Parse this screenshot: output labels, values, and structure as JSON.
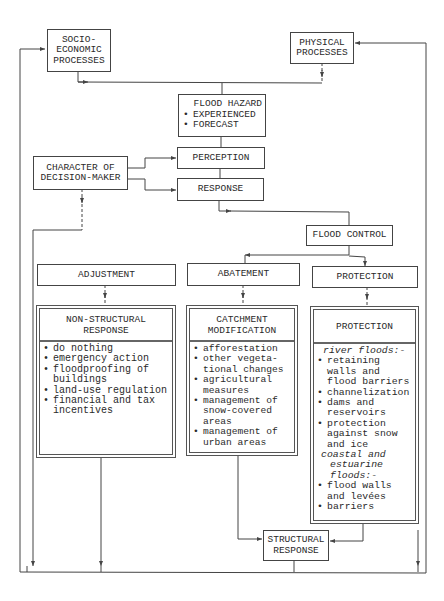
{
  "diagram": {
    "nodes": {
      "socio": {
        "lines": [
          "SOCIO-",
          "ECONOMIC",
          "PROCESSES"
        ]
      },
      "physical": {
        "lines": [
          "PHYSICAL",
          "PROCESSES"
        ]
      },
      "hazard": {
        "title": "FLOOD HAZARD",
        "bullets": [
          "EXPERIENCED",
          "FORECAST"
        ]
      },
      "character": {
        "lines": [
          "CHARACTER OF",
          "DECISION-MAKER"
        ]
      },
      "perception": {
        "label": "PERCEPTION"
      },
      "response": {
        "label": "RESPONSE"
      },
      "flood_control": {
        "label": "FLOOD CONTROL"
      },
      "adjustment": {
        "label": "ADJUSTMENT"
      },
      "abatement": {
        "label": "ABATEMENT"
      },
      "protection": {
        "label": "PROTECTION"
      },
      "non_structural": {
        "title": [
          "NON-STRUCTURAL",
          "RESPONSE"
        ],
        "items": [
          [
            "do nothing"
          ],
          [
            "emergency action"
          ],
          [
            "floodproofing of",
            "buildings"
          ],
          [
            "land-use regulation"
          ],
          [
            "financial and tax",
            "incentives"
          ]
        ]
      },
      "catchment": {
        "title": [
          "CATCHMENT",
          "MODIFICATION"
        ],
        "items": [
          [
            "afforestation"
          ],
          [
            "other vegeta-",
            "tional changes"
          ],
          [
            "agricultural",
            "measures"
          ],
          [
            "management of",
            "snow-covered",
            "areas"
          ],
          [
            "management of",
            "urban areas"
          ]
        ]
      },
      "protection_detail": {
        "title": "PROTECTION",
        "river_heading": "river floods:-",
        "river_items": [
          [
            "retaining",
            "walls and",
            "flood barriers"
          ],
          [
            "channelization"
          ],
          [
            "dams and",
            "reservoirs"
          ],
          [
            "protection",
            "against snow",
            "and ice"
          ]
        ],
        "coastal_heading": [
          "coastal and",
          "estuarine",
          "floods:-"
        ],
        "coastal_items": [
          [
            "flood walls",
            "and levées"
          ],
          [
            "barriers"
          ]
        ]
      },
      "structural": {
        "lines": [
          "STRUCTURAL",
          "RESPONSE"
        ]
      }
    },
    "colors": {
      "line": "#444444",
      "text": "#2a2a2a",
      "background": "#ffffff"
    }
  }
}
